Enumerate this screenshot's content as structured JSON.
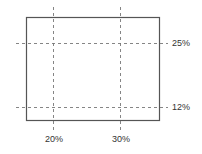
{
  "diagram": {
    "horizontal_guides": [
      {
        "label": "25%"
      },
      {
        "label": "12%"
      }
    ],
    "vertical_guides": [
      {
        "label": "20%"
      },
      {
        "label": "30%"
      }
    ],
    "colors": {
      "frame": "#555555",
      "guide": "#777777",
      "text": "#333333"
    }
  }
}
